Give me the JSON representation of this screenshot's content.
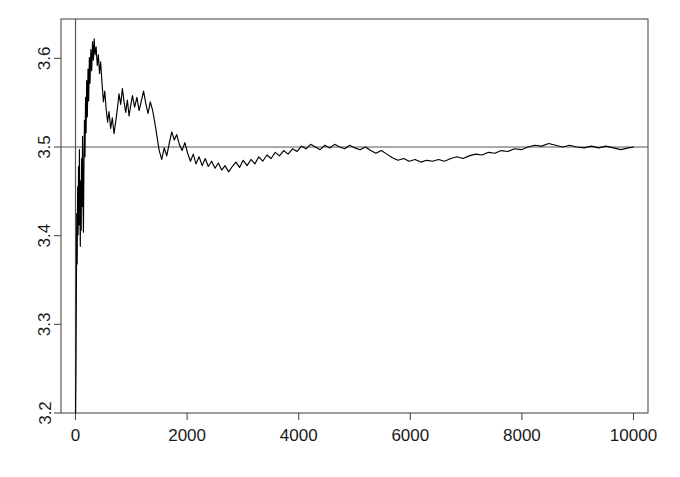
{
  "figure": {
    "width": 680,
    "height": 477,
    "background": "#ffffff",
    "line_color": "#000000",
    "axis_color": "#4d4d4d",
    "reference_line_color": "#555555"
  },
  "chart_data": {
    "type": "line",
    "title": "",
    "subtitle": "",
    "xlabel": "",
    "ylabel": "",
    "xlim": [
      -260,
      10260
    ],
    "ylim": [
      3.2,
      3.6444
    ],
    "grid": false,
    "legend": null,
    "annotations": [],
    "x_ticks": [
      0,
      2000,
      4000,
      6000,
      8000,
      10000
    ],
    "x_tick_labels": [
      "0",
      "2000",
      "4000",
      "6000",
      "8000",
      "10000"
    ],
    "y_ticks": [
      3.2,
      3.3,
      3.4,
      3.5,
      3.6
    ],
    "y_tick_labels": [
      "3.2",
      "3.3",
      "3.4",
      "3.5",
      "3.6"
    ],
    "y_tick_label_rotation": -90,
    "reference_lines": [
      {
        "orientation": "horizontal",
        "value": 3.5,
        "name": "true-mean-line"
      },
      {
        "orientation": "vertical",
        "value": 0,
        "name": "origin-line"
      }
    ],
    "series": [
      {
        "name": "running-mean",
        "color": "#000000",
        "x": [
          1,
          8,
          15,
          22,
          30,
          38,
          46,
          54,
          62,
          70,
          78,
          86,
          94,
          102,
          110,
          118,
          126,
          134,
          142,
          150,
          160,
          170,
          180,
          190,
          200,
          212,
          224,
          236,
          248,
          260,
          275,
          290,
          305,
          320,
          335,
          350,
          370,
          390,
          410,
          430,
          450,
          475,
          500,
          525,
          550,
          575,
          600,
          630,
          660,
          690,
          720,
          750,
          780,
          810,
          840,
          870,
          900,
          930,
          960,
          990,
          1020,
          1060,
          1100,
          1140,
          1180,
          1220,
          1260,
          1300,
          1340,
          1380,
          1420,
          1460,
          1500,
          1545,
          1590,
          1635,
          1680,
          1725,
          1770,
          1815,
          1860,
          1910,
          1960,
          2010,
          2060,
          2110,
          2160,
          2215,
          2270,
          2325,
          2380,
          2440,
          2500,
          2560,
          2620,
          2680,
          2745,
          2810,
          2875,
          2940,
          3005,
          3075,
          3145,
          3215,
          3285,
          3355,
          3430,
          3505,
          3580,
          3655,
          3730,
          3810,
          3890,
          3970,
          4050,
          4130,
          4215,
          4300,
          4385,
          4470,
          4555,
          4645,
          4735,
          4825,
          4915,
          5005,
          5100,
          5195,
          5290,
          5385,
          5480,
          5580,
          5680,
          5780,
          5880,
          5980,
          6085,
          6190,
          6295,
          6400,
          6505,
          6615,
          6725,
          6835,
          6945,
          7055,
          7170,
          7285,
          7400,
          7515,
          7630,
          7750,
          7870,
          7990,
          8110,
          8230,
          8355,
          8480,
          8605,
          8730,
          8855,
          8985,
          9115,
          9245,
          9375,
          9505,
          9640,
          9775,
          9910,
          10000
        ],
        "y": [
          3.2,
          3.245,
          3.331,
          3.425,
          3.368,
          3.455,
          3.401,
          3.478,
          3.412,
          3.497,
          3.431,
          3.388,
          3.462,
          3.406,
          3.487,
          3.433,
          3.512,
          3.448,
          3.404,
          3.471,
          3.53,
          3.489,
          3.556,
          3.516,
          3.575,
          3.534,
          3.588,
          3.552,
          3.601,
          3.572,
          3.61,
          3.586,
          3.619,
          3.598,
          3.622,
          3.604,
          3.613,
          3.592,
          3.604,
          3.583,
          3.596,
          3.572,
          3.551,
          3.563,
          3.542,
          3.528,
          3.54,
          3.521,
          3.533,
          3.515,
          3.528,
          3.543,
          3.56,
          3.548,
          3.566,
          3.551,
          3.539,
          3.553,
          3.535,
          3.547,
          3.558,
          3.545,
          3.556,
          3.541,
          3.552,
          3.563,
          3.549,
          3.538,
          3.551,
          3.542,
          3.528,
          3.512,
          3.496,
          3.486,
          3.499,
          3.49,
          3.504,
          3.517,
          3.508,
          3.514,
          3.503,
          3.496,
          3.505,
          3.493,
          3.484,
          3.492,
          3.481,
          3.489,
          3.479,
          3.487,
          3.478,
          3.484,
          3.476,
          3.482,
          3.474,
          3.479,
          3.472,
          3.478,
          3.483,
          3.477,
          3.485,
          3.479,
          3.486,
          3.481,
          3.489,
          3.484,
          3.491,
          3.487,
          3.494,
          3.49,
          3.496,
          3.492,
          3.498,
          3.495,
          3.501,
          3.498,
          3.503,
          3.5,
          3.497,
          3.502,
          3.499,
          3.503,
          3.5,
          3.498,
          3.502,
          3.499,
          3.497,
          3.5,
          3.496,
          3.493,
          3.496,
          3.492,
          3.488,
          3.485,
          3.487,
          3.484,
          3.486,
          3.483,
          3.485,
          3.484,
          3.486,
          3.484,
          3.487,
          3.489,
          3.487,
          3.49,
          3.492,
          3.491,
          3.494,
          3.493,
          3.496,
          3.495,
          3.498,
          3.497,
          3.5,
          3.502,
          3.501,
          3.504,
          3.502,
          3.5,
          3.502,
          3.5,
          3.499,
          3.501,
          3.499,
          3.501,
          3.499,
          3.497,
          3.499,
          3.5
        ]
      }
    ]
  }
}
